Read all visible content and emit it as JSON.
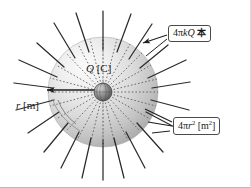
{
  "figure": {
    "background_color": "#ffffff",
    "border_color": "#b9b9b9",
    "width": 251,
    "height": 188
  },
  "sphere": {
    "name": "gaussian-sphere",
    "center_x": 103,
    "center_y": 92,
    "radius": 55,
    "fill_light": "#f2f2f2",
    "fill_mid": "#cfcfcf",
    "fill_dark": "#9b9b9b"
  },
  "charge": {
    "name": "point-charge",
    "center_x": 103,
    "center_y": 92,
    "radius": 9,
    "fill": "#6e6e6e"
  },
  "field_lines": {
    "name": "electric-field-lines",
    "count": 24,
    "color": "#2b2b2b",
    "dotted_color": "#4a4a4a"
  },
  "labels": {
    "charge": {
      "symbol": "Q",
      "unit": "[C]",
      "full": "Q [C]"
    },
    "radius": {
      "symbol": "r",
      "unit": "[m]",
      "full": "r [m]"
    },
    "flux": {
      "prefix": "4",
      "pi": "π",
      "k": "k",
      "q": "Q",
      "suffix": "本",
      "full": "4πkQ 本"
    },
    "area": {
      "prefix": "4",
      "pi": "π",
      "r": "r",
      "exp": "2",
      "unit_open": "[m",
      "unit_exp": "2",
      "unit_close": "]",
      "full": "4πr² [m²]"
    }
  }
}
